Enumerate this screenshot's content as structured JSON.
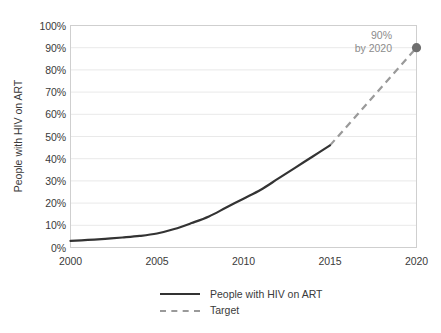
{
  "chart_data": {
    "type": "line",
    "title": "",
    "xlabel": "",
    "ylabel": "People with HIV on ART",
    "xlim": [
      2000,
      2020
    ],
    "ylim": [
      0,
      100
    ],
    "grid": true,
    "x_ticks": [
      "2000",
      "2005",
      "2010",
      "2015",
      "2020"
    ],
    "y_ticks": [
      "0%",
      "10%",
      "20%",
      "30%",
      "40%",
      "50%",
      "60%",
      "70%",
      "80%",
      "90%",
      "100%"
    ],
    "legend_position": "bottom",
    "series": [
      {
        "name": "People with HIV on ART",
        "style": "solid",
        "color": "#333333",
        "x": [
          2000,
          2001,
          2002,
          2003,
          2004,
          2005,
          2006,
          2007,
          2008,
          2009,
          2010,
          2011,
          2012,
          2013,
          2014,
          2015
        ],
        "values": [
          3,
          3.4,
          3.9,
          4.5,
          5.2,
          6.3,
          8.3,
          11,
          14,
          18,
          22,
          26,
          31,
          36,
          41,
          46
        ]
      },
      {
        "name": "Target",
        "style": "dashed",
        "color": "#9a9a9a",
        "x": [
          2015,
          2020
        ],
        "values": [
          46,
          90
        ],
        "end_marker": true
      }
    ],
    "annotations": [
      {
        "name": "target-callout",
        "line1": "90%",
        "line2": "by 2020",
        "color": "#8c8c8c",
        "at_x": 2020,
        "at_y": 90
      }
    ]
  },
  "legend": {
    "items": [
      {
        "label": "People with HIV on ART",
        "style": "solid"
      },
      {
        "label": "Target",
        "style": "dashed"
      }
    ]
  },
  "colors": {
    "background": "#ffffff",
    "grid": "#e9e9e9",
    "axis": "#cfcfcf",
    "text": "#3a3a3a",
    "series_actual": "#333333",
    "series_target": "#9a9a9a"
  }
}
